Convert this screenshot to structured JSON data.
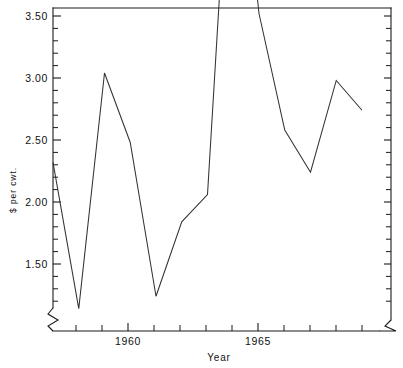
{
  "chart_data": {
    "type": "line",
    "title": "",
    "subtitle": "",
    "xlabel": "Year",
    "ylabel": "$ per cwt.",
    "x": [
      1957,
      1958,
      1959,
      1960,
      1961,
      1962,
      1963,
      1964,
      1965,
      1966,
      1967,
      1968,
      1969
    ],
    "values": [
      1.91,
      1.32,
      2.27,
      1.99,
      1.37,
      1.67,
      1.78,
      3.5,
      2.51,
      2.04,
      1.87,
      2.24,
      2.12
    ],
    "series": [
      {
        "name": "$ per cwt.",
        "values": [
          1.91,
          1.32,
          2.27,
          1.99,
          1.37,
          1.67,
          1.78,
          3.5,
          2.51,
          2.04,
          1.87,
          2.24,
          2.12
        ]
      }
    ],
    "xlim": [
      1957,
      1969
    ],
    "ylim": [
      1.25,
      3.62
    ],
    "x_major_ticks": [
      1960,
      1965
    ],
    "x_major_tick_labels": [
      "1960",
      "1965"
    ],
    "x_minor_ticks": [
      1957,
      1958,
      1959,
      1961,
      1962,
      1963,
      1964,
      1966,
      1967,
      1968,
      1969
    ],
    "y_major_ticks": [
      1.5,
      2.0,
      2.5,
      3.0,
      3.5
    ],
    "y_major_tick_labels": [
      "1.50",
      "2.00",
      "2.50",
      "3.00",
      "3.50"
    ],
    "y_minor_tick_step": 0.1,
    "grid": false,
    "legend": false,
    "legend_position": "none",
    "axis_break_x_left": true,
    "axis_break_x_right": true,
    "axis_break_y_bottom": true,
    "line_color": "#333333",
    "axis_color": "#1a1a1a",
    "background_color": "#ffffff",
    "markers": false
  },
  "axis_labels": {
    "y_title": "$ per cwt.",
    "x_title": "Year"
  },
  "ytick_labels": [
    "3.50",
    "3.00",
    "2.50",
    "2.00",
    "1.50"
  ],
  "xtick_labels": [
    "1960",
    "1965"
  ]
}
